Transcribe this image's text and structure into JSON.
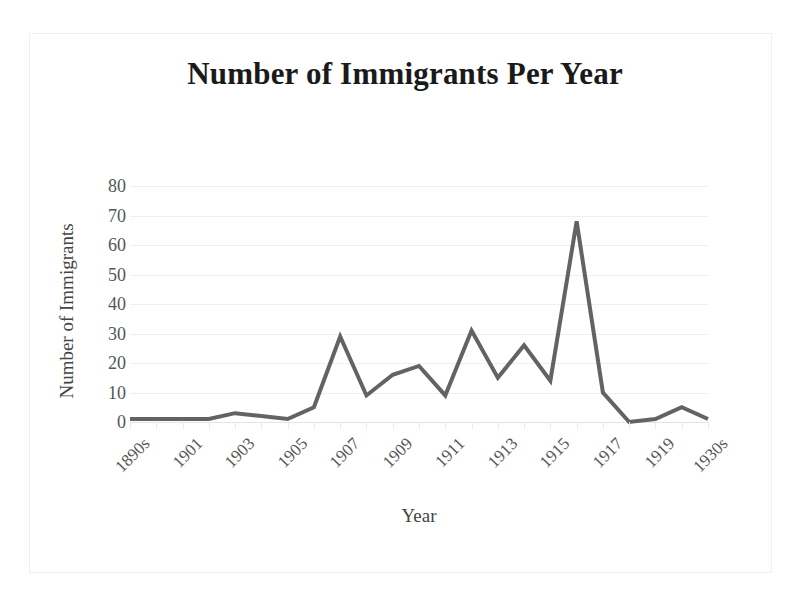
{
  "chart_data": {
    "type": "line",
    "title": "Number of Immigrants Per Year",
    "xlabel": "Year",
    "ylabel": "Number of Immigrants",
    "ylim": [
      0,
      80
    ],
    "yticks": [
      80,
      70,
      60,
      50,
      40,
      30,
      20,
      10,
      0
    ],
    "grid": true,
    "legend": null,
    "legend_position": "none",
    "line_color": "#636363",
    "line_width": 4,
    "categories": [
      "1890s",
      "1900",
      "1901",
      "1902",
      "1903",
      "1904",
      "1905",
      "1906",
      "1907",
      "1908",
      "1909",
      "1910",
      "1911",
      "1912",
      "1913",
      "1914",
      "1915",
      "1916",
      "1917",
      "1918",
      "1919",
      "1920s",
      "1930s"
    ],
    "tick_labels_visible": [
      "1890s",
      "1901",
      "1903",
      "1905",
      "1907",
      "1909",
      "1911",
      "1913",
      "1915",
      "1917",
      "1919",
      "1930s"
    ],
    "tick_label_indices": [
      0,
      2,
      4,
      6,
      8,
      10,
      12,
      14,
      16,
      18,
      20,
      22
    ],
    "tick_label_rotation": -45,
    "values": [
      1,
      1,
      1,
      1,
      3,
      2,
      1,
      5,
      29,
      9,
      16,
      19,
      9,
      31,
      15,
      26,
      14,
      68,
      10,
      0,
      1,
      5,
      1
    ],
    "series": [
      {
        "name": "Number of Immigrants",
        "values": [
          1,
          1,
          1,
          1,
          3,
          2,
          1,
          5,
          29,
          9,
          16,
          19,
          9,
          31,
          15,
          26,
          14,
          68,
          10,
          0,
          1,
          5,
          1
        ]
      }
    ]
  },
  "colors": {
    "line": "#636363",
    "gridline": "#efefef",
    "axis_text": "#555555",
    "title_text": "#1a1a1a",
    "frame": "#f0f0f0",
    "background": "#ffffff"
  }
}
